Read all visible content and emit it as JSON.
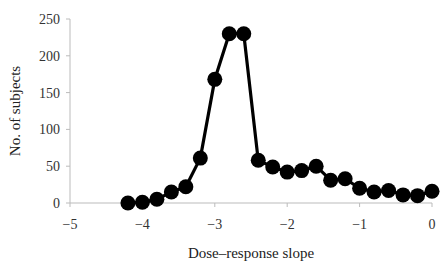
{
  "chart_data": {
    "type": "line",
    "title": "",
    "xlabel": "Dose–response slope",
    "ylabel": "No. of subjects",
    "xlim": [
      -5,
      0
    ],
    "ylim": [
      0,
      250
    ],
    "xticks": [
      -5,
      -4,
      -3,
      -2,
      -1,
      0
    ],
    "xtick_labels": [
      "−5",
      "−4",
      "−3",
      "−2",
      "−1",
      "0"
    ],
    "yticks": [
      0,
      50,
      100,
      150,
      200,
      250
    ],
    "ytick_labels": [
      "0",
      "50",
      "100",
      "150",
      "200",
      "250"
    ],
    "grid": false,
    "legend": null,
    "marker": "filled-circle",
    "series": [
      {
        "name": "Subjects",
        "color": "#000000",
        "x": [
          -4.2,
          -4.0,
          -3.8,
          -3.6,
          -3.4,
          -3.2,
          -3.0,
          -2.8,
          -2.6,
          -2.4,
          -2.2,
          -2.0,
          -1.8,
          -1.6,
          -1.4,
          -1.2,
          -1.0,
          -0.8,
          -0.6,
          -0.4,
          -0.2,
          0.0
        ],
        "values": [
          0,
          1,
          5,
          15,
          22,
          61,
          168,
          230,
          230,
          58,
          49,
          42,
          44,
          50,
          31,
          33,
          20,
          15,
          17,
          11,
          10,
          16
        ]
      }
    ]
  },
  "colors": {
    "axis": "#bbbbbb",
    "line": "#000000",
    "marker": "#000000"
  }
}
